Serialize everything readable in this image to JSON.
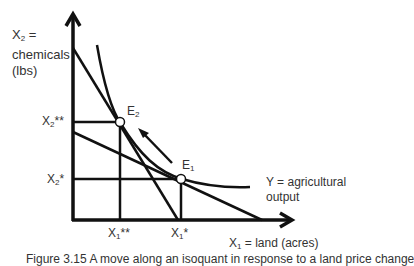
{
  "diagram": {
    "y_axis_label": {
      "var": "X",
      "sub": "2",
      "text": " =",
      "line2": "chemicals",
      "line3": "(lbs)"
    },
    "x_axis_label": {
      "var": "X",
      "sub": "1",
      "text": " = land (acres)"
    },
    "tick_labels": {
      "x2_double_star": {
        "var": "X",
        "sub": "2",
        "suffix": "**"
      },
      "x2_star": {
        "var": "X",
        "sub": "2",
        "suffix": "*"
      },
      "x1_double_star": {
        "var": "X",
        "sub": "1",
        "suffix": "**"
      },
      "x1_star": {
        "var": "X",
        "sub": "1",
        "suffix": "*"
      }
    },
    "points": {
      "e1": {
        "var": "E",
        "sub": "1"
      },
      "e2": {
        "var": "E",
        "sub": "2"
      }
    },
    "isoquant_label": {
      "line1": "Y = agricultural",
      "line2": "output"
    },
    "caption": "Figure 3.15 A move along an isoquant in response to a land price change"
  }
}
